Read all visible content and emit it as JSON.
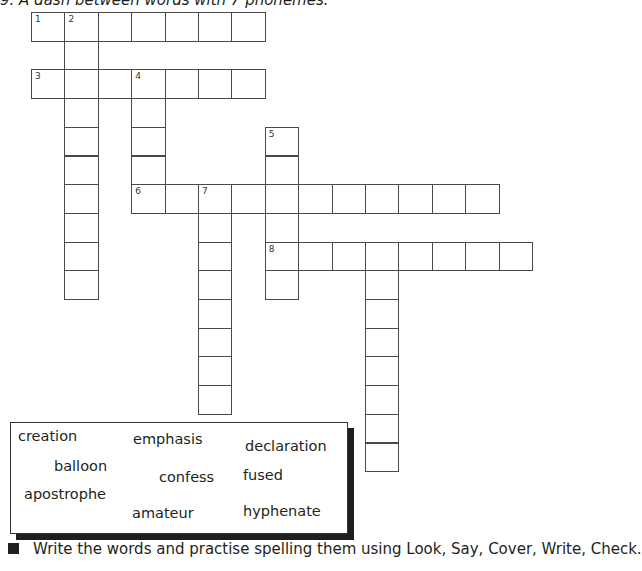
{
  "header": {
    "clue_text": "9. A dash between words with 7 phonemes."
  },
  "grid": {
    "origin": [
      31,
      12
    ],
    "cell": [
      33.4,
      28.7
    ],
    "entries": [
      {
        "number": "1",
        "direction": "across",
        "row": 0,
        "col": 0,
        "length": 7
      },
      {
        "number": "2",
        "direction": "down",
        "row": 0,
        "col": 1,
        "length": 10
      },
      {
        "number": "3",
        "direction": "across",
        "row": 2,
        "col": 0,
        "length": 7
      },
      {
        "number": "4",
        "direction": "down",
        "row": 2,
        "col": 3,
        "length": 5
      },
      {
        "number": "5",
        "direction": "down",
        "row": 4,
        "col": 7,
        "length": 6
      },
      {
        "number": "6",
        "direction": "across",
        "row": 6,
        "col": 3,
        "length": 11
      },
      {
        "number": "7",
        "direction": "down",
        "row": 6,
        "col": 5,
        "length": 8
      },
      {
        "number": "8",
        "direction": "across",
        "row": 8,
        "col": 7,
        "length": 8
      },
      {
        "number": "",
        "direction": "down",
        "row": 8,
        "col": 10,
        "length": 8
      }
    ]
  },
  "word_box": {
    "words": [
      {
        "text": "creation",
        "x": 18,
        "y": 428
      },
      {
        "text": "emphasis",
        "x": 133,
        "y": 431
      },
      {
        "text": "declaration",
        "x": 245,
        "y": 438
      },
      {
        "text": "balloon",
        "x": 54,
        "y": 458
      },
      {
        "text": "confess",
        "x": 159,
        "y": 469
      },
      {
        "text": "fused",
        "x": 243,
        "y": 467
      },
      {
        "text": "apostrophe",
        "x": 24,
        "y": 486
      },
      {
        "text": "amateur",
        "x": 132,
        "y": 505
      },
      {
        "text": "hyphenate",
        "x": 243,
        "y": 503
      }
    ]
  },
  "instruction": {
    "text": "Write the words and practise spelling them using Look, Say, Cover, Write, Check."
  }
}
